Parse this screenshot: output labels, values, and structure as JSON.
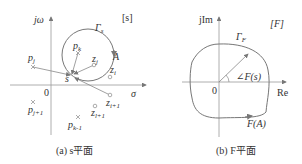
{
  "figure": {
    "panel_a": {
      "caption": "(a) s平面",
      "plane_tag": "[s]",
      "y_axis_label": "jω",
      "x_axis_label": "σ",
      "origin_label": "0",
      "contour_label": "Γ",
      "contour_sub": "s",
      "point_label": "A",
      "test_point_label": "s",
      "poles": [
        {
          "name": "p",
          "sub": "k"
        },
        {
          "name": "p",
          "sub": "j"
        },
        {
          "name": "p",
          "sub": "j+1"
        },
        {
          "name": "p",
          "sub": "k-1"
        }
      ],
      "zeros": [
        {
          "name": "z",
          "sub": "j"
        },
        {
          "name": "z",
          "sub": "i"
        },
        {
          "name": "z",
          "sub": "i+1"
        },
        {
          "name": "z",
          "sub": "l+1"
        }
      ]
    },
    "panel_b": {
      "caption": "(b) F平面",
      "plane_tag": "[F]",
      "y_axis_label": "jIm",
      "x_axis_label": "Re",
      "origin_label": "0",
      "contour_label": "Γ",
      "contour_sub": "F",
      "angle_label": "∠F(s)",
      "mapped_point_label": "F(A)"
    }
  }
}
